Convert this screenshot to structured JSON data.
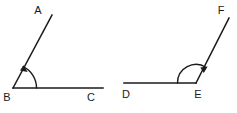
{
  "figure": {
    "background_color": "#ffffff",
    "stroke_color": "#1a1a1a",
    "label_color": "#1a1a1a",
    "angle_1": {
      "name": "angle-ABC",
      "vertex_label": "B",
      "ray_upper_label": "A",
      "ray_lower_label": "C",
      "arc_direction": "counterclockwise-from-horizontal",
      "arrow_at": "ray-BA"
    },
    "angle_2": {
      "name": "angle-DEF",
      "vertex_label": "E",
      "ray_left_label": "D",
      "ray_upper_label": "F",
      "arc_direction": "clockwise-from-horizontal",
      "arrow_at": "ray-EF"
    }
  }
}
